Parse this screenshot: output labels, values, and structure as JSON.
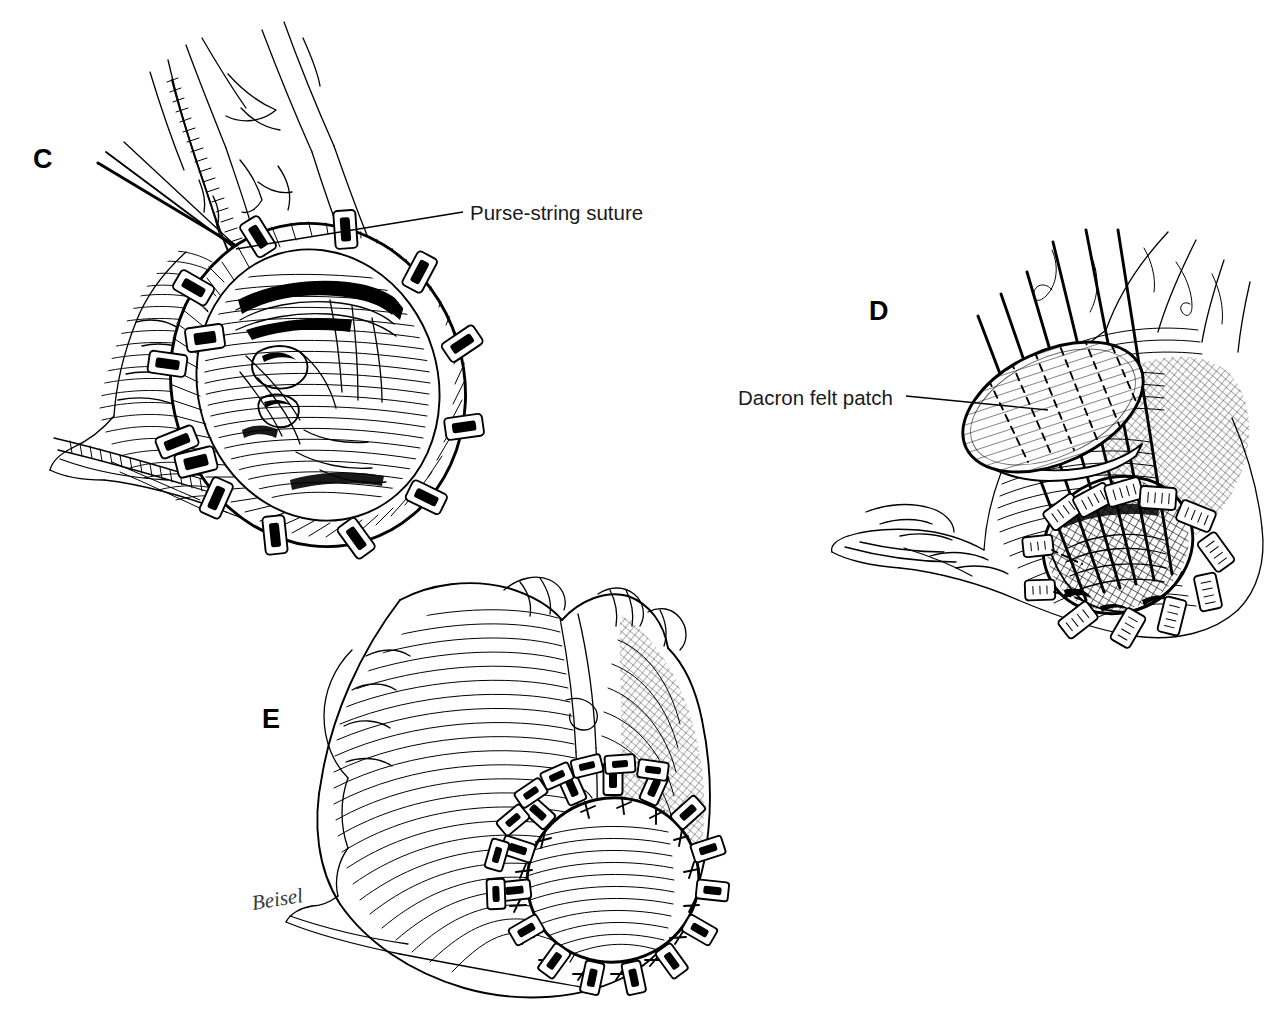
{
  "figure": {
    "background_color": "#ffffff",
    "ink_color": "#000000",
    "medium": "pen-and-ink line drawing",
    "width": 1268,
    "height": 1016
  },
  "panels": [
    {
      "id": "C",
      "letter": "C",
      "letter_x": 33,
      "letter_y": 168,
      "subject": "Apical ventriculotomy with pledgeted purse-string suture being placed",
      "callout": {
        "label": "Purse-string suture",
        "text_x": 470,
        "text_y": 220,
        "leader_from_x": 236,
        "leader_from_y": 249,
        "leader_to_x": 463,
        "leader_to_y": 212
      },
      "features": [
        "surgical needle and needle holder",
        "crosshatched purse-string suture line",
        "pledgets around ventriculotomy rim",
        "trabeculated endocardial surface visible inside opening"
      ],
      "pledget_count": 13
    },
    {
      "id": "D",
      "letter": "D",
      "letter_x": 869,
      "letter_y": 320,
      "subject": "Dacron felt patch threaded onto pledgeted sutures before seating",
      "callout": {
        "label": "Dacron felt patch",
        "text_x": 738,
        "text_y": 405,
        "leader_from_x": 1048,
        "leader_from_y": 410,
        "leader_to_x": 906,
        "leader_to_y": 396
      },
      "features": [
        "elliptical felt patch with parallel hatch texture",
        "six suture strands passing through the patch",
        "exposed ventricular cavity with trabeculae below",
        "pledgets encircling the opening"
      ],
      "suture_strand_count": 6,
      "pledget_count": 12
    },
    {
      "id": "E",
      "letter": "E",
      "letter_x": 262,
      "letter_y": 728,
      "subject": "Completed apical closure with patch seated and sutures tied",
      "callout": null,
      "features": [
        "whole heart in left anterior oblique view",
        "completed circular patch closure at apex",
        "ring of tied pledgeted sutures",
        "epicardial fat and coronary vessels"
      ],
      "pledget_count": 22
    }
  ],
  "signature": {
    "text": "Beisel",
    "x": 253,
    "y": 910,
    "rotation_deg": -9
  },
  "callout_style": {
    "font_size_px": 20.5,
    "color": "#1a1a1a",
    "leader_stroke_width": 1.4
  },
  "letter_style": {
    "font_size_px": 27,
    "weight": "bold",
    "color": "#000000"
  }
}
